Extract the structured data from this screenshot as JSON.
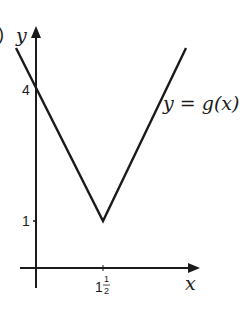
{
  "figure": {
    "part_marker": ")",
    "x_axis_label": "x",
    "y_axis_label": "y",
    "curve_label": "y = g(x)",
    "y_ticks": [
      {
        "value": 4,
        "label": "4"
      },
      {
        "value": 1,
        "label": "1"
      }
    ],
    "x_ticks": [
      {
        "value": 1.5,
        "label_whole": "1",
        "label_num": "1",
        "label_den": "2"
      }
    ],
    "vertex": {
      "x": 1.5,
      "y": 1
    },
    "y_intercept": 4,
    "colors": {
      "line": "#1a1a1a",
      "background": "#ffffff"
    }
  }
}
